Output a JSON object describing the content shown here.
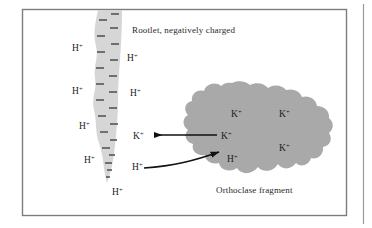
{
  "figure": {
    "type": "scientific-diagram",
    "background_color": "#ffffff",
    "frame": {
      "border_color": "#7a7a7a",
      "x": 22,
      "y": 9,
      "width": 325,
      "height": 207,
      "right_rule_x": 363
    },
    "rootlet": {
      "label": "Rootlet, negatively charged",
      "label_x": 132,
      "label_y": 30,
      "fill_color": "#d6d6d6",
      "charge_symbol": "–",
      "charge_symbol_count": 22,
      "charge_symbol_color": "#4a4a4a"
    },
    "fragment": {
      "label": "Orthoclase fragment",
      "label_x": 216,
      "label_y": 190,
      "fill_color": "#a9a9a9"
    },
    "ions": {
      "hydrogen": "H",
      "potassium": "K",
      "charge": "+"
    },
    "rootlet_hydrogen_ions": [
      {
        "x": 78,
        "y": 48
      },
      {
        "x": 78,
        "y": 91
      },
      {
        "x": 85,
        "y": 126
      },
      {
        "x": 90,
        "y": 160
      },
      {
        "x": 118,
        "y": 192
      }
    ],
    "solution_hydrogen_ions": [
      {
        "x": 128,
        "y": 58
      },
      {
        "x": 131,
        "y": 93
      },
      {
        "x": 133,
        "y": 167
      }
    ],
    "solution_potassium_ions": [
      {
        "x": 137,
        "y": 136
      }
    ],
    "fragment_potassium_ions": [
      {
        "x": 236,
        "y": 114
      },
      {
        "x": 284,
        "y": 114
      },
      {
        "x": 226,
        "y": 136
      },
      {
        "x": 284,
        "y": 148
      }
    ],
    "fragment_hydrogen_ions": [
      {
        "x": 232,
        "y": 159
      }
    ],
    "arrows": [
      {
        "name": "potassium-release-arrow",
        "direction": "leftward",
        "style": "straight",
        "from": "orthoclase fragment",
        "to": "rootlet surface",
        "ion": "K+",
        "color": "#111111"
      },
      {
        "name": "hydrogen-uptake-arrow",
        "direction": "rightward",
        "style": "curved",
        "from": "rootlet surface",
        "to": "orthoclase fragment",
        "ion": "H+",
        "color": "#111111"
      }
    ]
  }
}
